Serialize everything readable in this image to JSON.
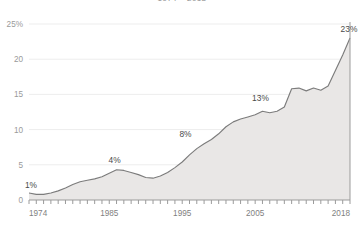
{
  "title": "1974 – 2018",
  "chart_data": {
    "type": "area",
    "title": "1974 – 2018",
    "subtitle": "",
    "xlabel": "",
    "ylabel": "",
    "xlim": [
      1974,
      2018
    ],
    "ylim": [
      0,
      25
    ],
    "grid": true,
    "legend_position": "none",
    "y_ticks": [
      "25%",
      "20",
      "15",
      "10",
      "5",
      "0"
    ],
    "y_tick_values": [
      25,
      20,
      15,
      10,
      5,
      0
    ],
    "x_ticks": [
      "1974",
      "1985",
      "1995",
      "2005",
      "2018"
    ],
    "x_tick_values": [
      1974,
      1985,
      1995,
      2005,
      2018
    ],
    "x_minor_ticks_every": 1,
    "annotations": [
      {
        "label": "1%",
        "x": 1974,
        "y": 1.0
      },
      {
        "label": "4%",
        "x": 1986,
        "y": 4.3
      },
      {
        "label": "8%",
        "x": 1996,
        "y": 8.0
      },
      {
        "label": "13%",
        "x": 2006,
        "y": 13.0
      },
      {
        "label": "23%",
        "x": 2018,
        "y": 23.0
      }
    ],
    "series": [
      {
        "name": "Share",
        "color": "#7c7c7c",
        "fill": "#e9e7e6",
        "x": [
          1974,
          1975,
          1976,
          1977,
          1978,
          1979,
          1980,
          1981,
          1982,
          1983,
          1984,
          1985,
          1986,
          1987,
          1988,
          1989,
          1990,
          1991,
          1992,
          1993,
          1994,
          1995,
          1996,
          1997,
          1998,
          1999,
          2000,
          2001,
          2002,
          2003,
          2004,
          2005,
          2006,
          2007,
          2008,
          2009,
          2010,
          2011,
          2012,
          2013,
          2014,
          2015,
          2016,
          2017,
          2018
        ],
        "values": [
          1.0,
          0.8,
          0.8,
          1.0,
          1.3,
          1.7,
          2.2,
          2.6,
          2.8,
          3.0,
          3.3,
          3.8,
          4.3,
          4.2,
          3.9,
          3.6,
          3.2,
          3.1,
          3.4,
          3.9,
          4.6,
          5.4,
          6.4,
          7.3,
          8.0,
          8.6,
          9.4,
          10.4,
          11.1,
          11.5,
          11.8,
          12.1,
          12.6,
          12.4,
          12.6,
          13.2,
          15.8,
          15.9,
          15.5,
          15.9,
          15.6,
          16.2,
          18.4,
          20.6,
          23.0
        ]
      }
    ]
  }
}
